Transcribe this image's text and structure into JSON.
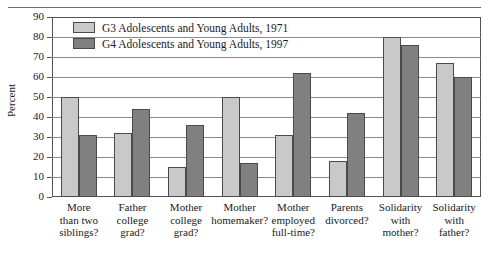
{
  "chart_data": {
    "type": "bar",
    "title": "",
    "xlabel": "",
    "ylabel": "Percent",
    "ylim": [
      0,
      90
    ],
    "yticks": [
      0,
      10,
      20,
      30,
      40,
      50,
      60,
      70,
      80,
      90
    ],
    "grid": true,
    "legend_position": "top-left-inside",
    "categories": [
      "More than two siblings?",
      "Father college grad?",
      "Mother college grad?",
      "Mother homemaker?",
      "Mother employed full-time?",
      "Parents divorced?",
      "Solidarity with mother?",
      "Solidarity with father?"
    ],
    "category_lines": [
      [
        "More",
        "than two",
        "siblings?"
      ],
      [
        "Father",
        "college",
        "grad?"
      ],
      [
        "Mother",
        "college",
        "grad?"
      ],
      [
        "Mother",
        "homemaker?"
      ],
      [
        "Mother",
        "employed",
        "full-time?"
      ],
      [
        "Parents",
        "divorced?"
      ],
      [
        "Solidarity",
        "with",
        "mother?"
      ],
      [
        "Solidarity",
        "with",
        "father?"
      ]
    ],
    "series": [
      {
        "name": "G3 Adolescents and Young Adults, 1971",
        "color": "#c9c9c9",
        "values": [
          50,
          32,
          15,
          50,
          31,
          18,
          80,
          67
        ]
      },
      {
        "name": "G4 Adolescents and Young Adults, 1997",
        "color": "#808080",
        "values": [
          31,
          44,
          36,
          17,
          62,
          42,
          76,
          60
        ]
      }
    ]
  },
  "legend": {
    "items": [
      {
        "label": "G3 Adolescents and Young Adults, 1971",
        "swatch": "g3"
      },
      {
        "label": "G4 Adolescents and Young Adults, 1997",
        "swatch": "g4"
      }
    ]
  },
  "axis": {
    "y_title": "Percent",
    "y_ticks": [
      "90",
      "80",
      "70",
      "60",
      "50",
      "40",
      "30",
      "20",
      "10",
      "0"
    ]
  }
}
